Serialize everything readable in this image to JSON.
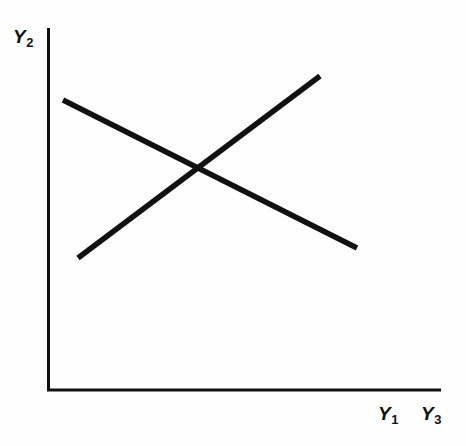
{
  "figure": {
    "background_color": "#fefefe",
    "ink_color": "#111111",
    "width": 466,
    "height": 446
  },
  "axes": {
    "y_axis": {
      "label_var": "Y",
      "label_sub": "2",
      "label_full": "Y2"
    },
    "x_axis": {
      "label_1_var": "Y",
      "label_1_sub": "1",
      "label_1_full": "Y1",
      "label_2_var": "Y",
      "label_2_sub": "3",
      "label_2_full": "Y3"
    }
  },
  "chart_data": {
    "type": "line",
    "title": "",
    "subtitle": "",
    "xlabel": "Y1 Y3",
    "ylabel": "Y2",
    "grid": false,
    "legend": null,
    "legend_position": "none",
    "xlim": [
      0,
      1
    ],
    "ylim": [
      0,
      1
    ],
    "axis_style": "open-corner-two-spine",
    "annotations": [],
    "tick_labels": {
      "x": [],
      "y": []
    },
    "series": [
      {
        "name": "descending-line",
        "kind": "straight-segment",
        "slope_sign": "negative",
        "color": "#111111",
        "linewidth_px": 5,
        "pixel_endpoints": [
          [
            63,
            100
          ],
          [
            357,
            248
          ]
        ],
        "x": [
          0.038,
          0.786
        ],
        "values": [
          0.8,
          0.392
        ]
      },
      {
        "name": "ascending-line",
        "kind": "straight-segment",
        "slope_sign": "positive",
        "color": "#111111",
        "linewidth_px": 5,
        "pixel_endpoints": [
          [
            78,
            258
          ],
          [
            320,
            76
          ]
        ],
        "x": [
          0.076,
          0.692
        ],
        "values": [
          0.364,
          0.866
        ]
      }
    ],
    "intersection": {
      "pixel": [
        197,
        172
      ],
      "x": 0.379,
      "y": 0.601
    }
  }
}
